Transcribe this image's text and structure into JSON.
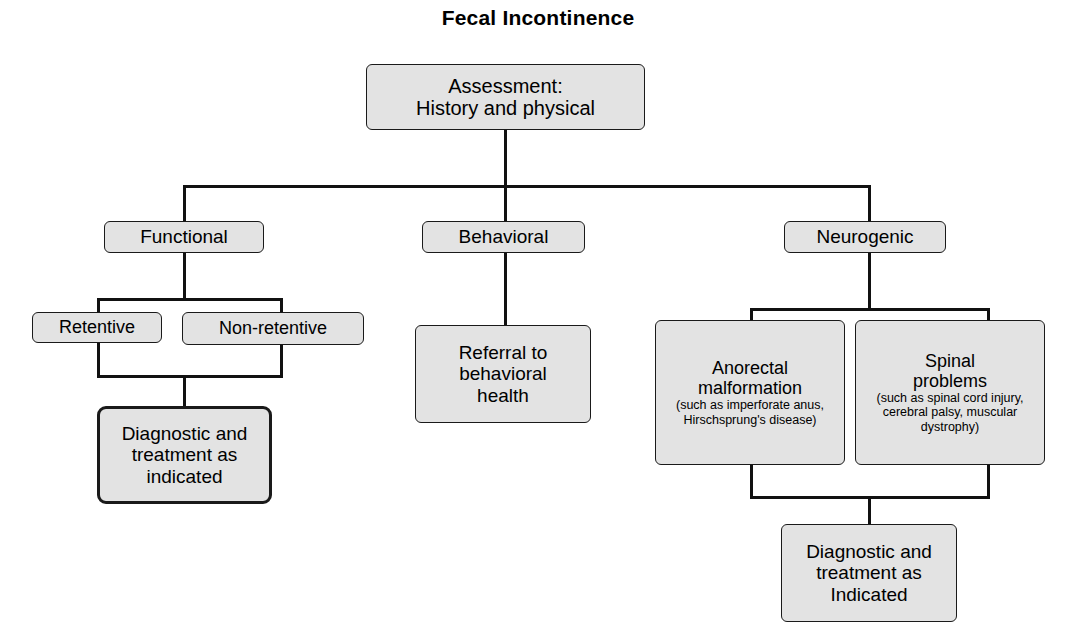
{
  "title": "Fecal Incontinence",
  "diagram": {
    "type": "flowchart",
    "background_color": "#ffffff",
    "node_fill_color": "#e3e3e3",
    "node_border_color": "#1a1a1a",
    "connector_color": "#111111",
    "nodes": {
      "assessment": {
        "line1": "Assessment:",
        "line2": "History and physical"
      },
      "functional": {
        "label": "Functional"
      },
      "behavioral": {
        "label": "Behavioral"
      },
      "neurogenic": {
        "label": "Neurogenic"
      },
      "retentive": {
        "label": "Retentive"
      },
      "non_retentive": {
        "label": "Non-retentive"
      },
      "referral": {
        "line1": "Referral to",
        "line2": "behavioral",
        "line3": "health"
      },
      "anorectal": {
        "line1": "Anorectal",
        "line2": "malformation",
        "sub1": "(such as imperforate anus,",
        "sub2": "Hirschsprung's disease)"
      },
      "spinal": {
        "line1": "Spinal",
        "line2": "problems",
        "sub1": "(such as spinal cord injury,",
        "sub2": "cerebral palsy, muscular",
        "sub3": "dystrophy)"
      },
      "diagnostic_left": {
        "line1": "Diagnostic and",
        "line2": "treatment as",
        "line3": "indicated"
      },
      "diagnostic_right": {
        "line1": "Diagnostic and",
        "line2": "treatment as",
        "line3": "Indicated"
      }
    }
  }
}
